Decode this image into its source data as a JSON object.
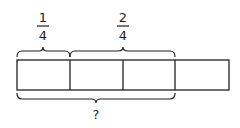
{
  "diagram": {
    "type": "tape-diagram",
    "total_parts": 4,
    "stroke_color": "#231f20",
    "top_labels": [
      {
        "numerator": "1",
        "denominator": "4",
        "spans_parts": [
          1
        ]
      },
      {
        "numerator": "2",
        "denominator": "4",
        "spans_parts": [
          2,
          3
        ]
      }
    ],
    "bottom_label": {
      "text": "?",
      "spans_parts": [
        1,
        2,
        3
      ]
    }
  }
}
